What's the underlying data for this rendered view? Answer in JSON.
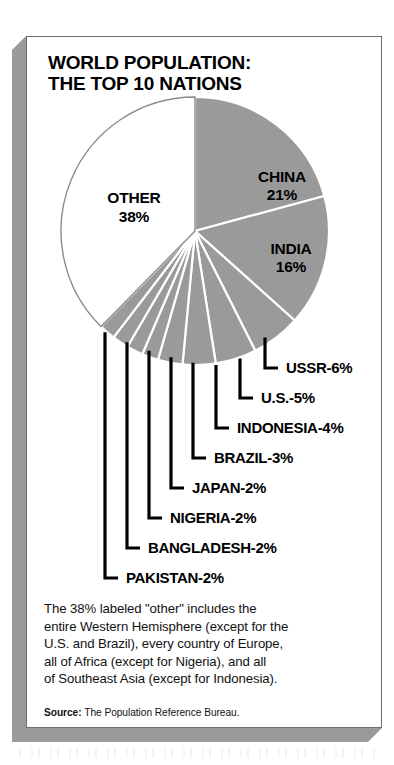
{
  "title": {
    "line1": "WORLD POPULATION:",
    "line2": "THE TOP 10 NATIONS"
  },
  "chart_data": {
    "type": "pie",
    "title": "WORLD POPULATION: THE TOP 10 NATIONS",
    "unit": "percent of world population",
    "start_angle_deg": 0,
    "direction": "clockwise",
    "legend": "none (direct labels with leader lines)",
    "categories": [
      "CHINA",
      "INDIA",
      "USSR",
      "U.S.",
      "INDONESIA",
      "BRAZIL",
      "JAPAN",
      "NIGERIA",
      "BANGLADESH",
      "PAKISTAN",
      "OTHER"
    ],
    "values": [
      21,
      16,
      6,
      5,
      4,
      3,
      2,
      2,
      2,
      2,
      38
    ],
    "colors": {
      "nations": "#9a9a9a",
      "other": "#ffffff",
      "slice_separator": "#ffffff",
      "outline": "#8c8c8c",
      "leader_line": "#000000"
    },
    "slices": [
      {
        "name": "CHINA",
        "value": 21,
        "label": "CHINA",
        "value_label": "21%",
        "fill": "#9a9a9a",
        "label_style": "inside"
      },
      {
        "name": "INDIA",
        "value": 16,
        "label": "INDIA",
        "value_label": "16%",
        "fill": "#9a9a9a",
        "label_style": "inside"
      },
      {
        "name": "USSR",
        "value": 6,
        "label": "USSR-6%",
        "value_label": "6%",
        "fill": "#9a9a9a",
        "label_style": "leader"
      },
      {
        "name": "U.S.",
        "value": 5,
        "label": "U.S.-5%",
        "value_label": "5%",
        "fill": "#9a9a9a",
        "label_style": "leader"
      },
      {
        "name": "INDONESIA",
        "value": 4,
        "label": "INDONESIA-4%",
        "value_label": "4%",
        "fill": "#9a9a9a",
        "label_style": "leader"
      },
      {
        "name": "BRAZIL",
        "value": 3,
        "label": "BRAZIL-3%",
        "value_label": "3%",
        "fill": "#9a9a9a",
        "label_style": "leader"
      },
      {
        "name": "JAPAN",
        "value": 2,
        "label": "JAPAN-2%",
        "value_label": "2%",
        "fill": "#9a9a9a",
        "label_style": "leader"
      },
      {
        "name": "NIGERIA",
        "value": 2,
        "label": "NIGERIA-2%",
        "value_label": "2%",
        "fill": "#9a9a9a",
        "label_style": "leader"
      },
      {
        "name": "BANGLADESH",
        "value": 2,
        "label": "BANGLADESH-2%",
        "value_label": "2%",
        "fill": "#9a9a9a",
        "label_style": "leader"
      },
      {
        "name": "PAKISTAN",
        "value": 2,
        "label": "PAKISTAN-2%",
        "value_label": "2%",
        "fill": "#9a9a9a",
        "label_style": "leader"
      },
      {
        "name": "OTHER",
        "value": 38,
        "label": "OTHER",
        "value_label": "38%",
        "fill": "#ffffff",
        "label_style": "inside"
      }
    ],
    "inside_labels": {
      "china_name": "CHINA",
      "china_value": "21%",
      "india_name": "INDIA",
      "india_value": "16%",
      "other_name": "OTHER",
      "other_value": "38%"
    },
    "leader_labels": [
      "USSR-6%",
      "U.S.-5%",
      "INDONESIA-4%",
      "BRAZIL-3%",
      "JAPAN-2%",
      "NIGERIA-2%",
      "BANGLADESH-2%",
      "PAKISTAN-2%"
    ]
  },
  "footnote": {
    "line1": "The 38% labeled \"other\" includes the",
    "line2": "entire Western Hemisphere (except for the",
    "line3": "U.S. and Brazil), every country of Europe,",
    "line4": "all of Africa (except for Nigeria), and all",
    "line5": "of Southeast Asia (except for Indonesia)."
  },
  "source": {
    "label": "Source:",
    "text": "The Population Reference Bureau."
  }
}
